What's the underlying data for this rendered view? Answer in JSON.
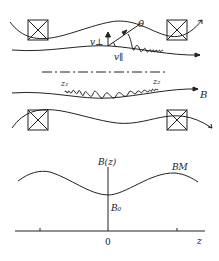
{
  "top_diagram": {
    "labels": {
      "theta": "θ",
      "v_perp": "v⊥",
      "v_par": "v∥",
      "z1": "z₁",
      "z2": "z₂",
      "B": "B"
    },
    "coils": 4
  },
  "bottom_graph": {
    "y_axis_label": "B(z)",
    "x_axis_label": "z",
    "origin_label": "0",
    "min_label": "B₀",
    "max_label": "BM"
  },
  "colors": {
    "ink": "#222222",
    "background": "#ffffff"
  }
}
